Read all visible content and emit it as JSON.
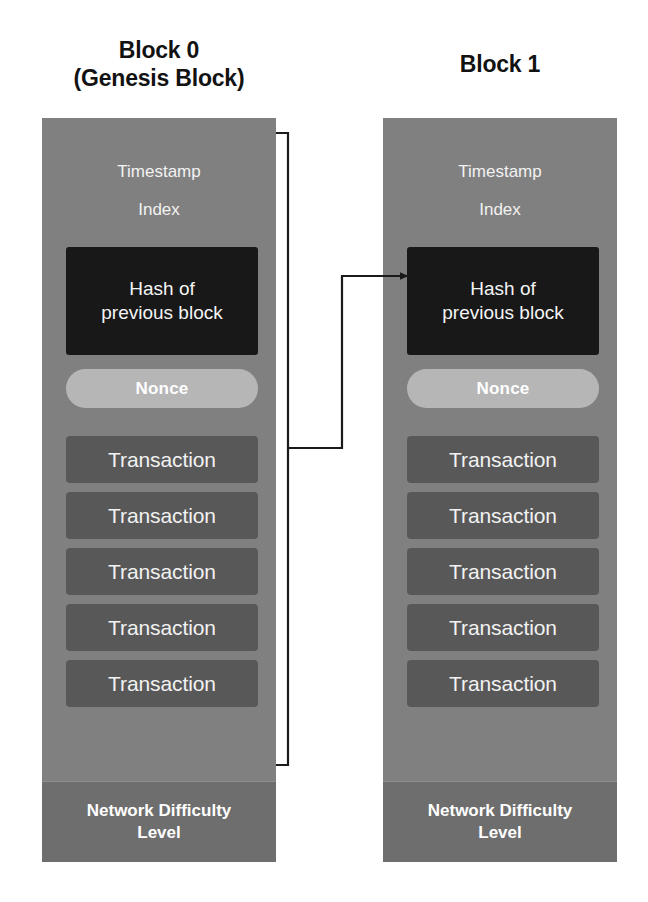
{
  "diagram": {
    "background_color": "#ffffff",
    "block_fill": "#808080",
    "hash_fill": "#181818",
    "nonce_fill": "#b6b6b6",
    "transaction_fill": "#585858",
    "footer_fill": "#6e6e6e",
    "connector_color": "#1a1a1a"
  },
  "blocks": [
    {
      "title": "Block 0\n(Genesis Block)",
      "timestamp_label": "Timestamp",
      "index_label": "Index",
      "hash_label": "Hash of\nprevious block",
      "nonce_label": "Nonce",
      "transactions": [
        "Transaction",
        "Transaction",
        "Transaction",
        "Transaction",
        "Transaction"
      ],
      "footer_label": "Network Difficulty\nLevel"
    },
    {
      "title": "Block 1",
      "timestamp_label": "Timestamp",
      "index_label": "Index",
      "hash_label": "Hash of\nprevious block",
      "nonce_label": "Nonce",
      "transactions": [
        "Transaction",
        "Transaction",
        "Transaction",
        "Transaction",
        "Transaction"
      ],
      "footer_label": "Network Difficulty\nLevel"
    }
  ],
  "connector": {
    "description": "Link from Block 0 body to Block 1 hash-of-previous-block field",
    "from_block": "Block 0",
    "to_block": "Block 1",
    "to_field": "Hash of previous block",
    "has_arrowhead": true
  }
}
